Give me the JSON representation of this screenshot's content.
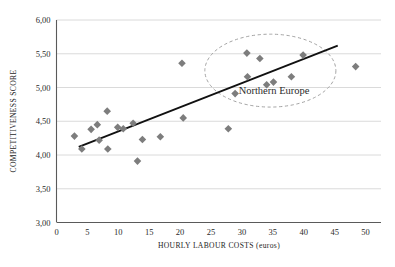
{
  "chart_data": {
    "type": "scatter",
    "title": "",
    "xlabel": "HOURLY LABOUR COSTS (euros)",
    "ylabel": "COMPETITIVENESS SCORE",
    "xlim": [
      0,
      52.5
    ],
    "ylim": [
      3.0,
      6.0
    ],
    "xticks": [
      0,
      5,
      10,
      15,
      20,
      25,
      30,
      35,
      40,
      45,
      50
    ],
    "xtick_labels": [
      "0",
      "5",
      "10",
      "15",
      "20",
      "25",
      "30",
      "35",
      "40",
      "45",
      "50"
    ],
    "yticks": [
      3.0,
      3.5,
      4.0,
      4.5,
      5.0,
      5.5,
      6.0
    ],
    "ytick_labels": [
      "3,00",
      "3,50",
      "4,00",
      "4,50",
      "5,00",
      "5,50",
      "6,00"
    ],
    "grid": "horizontal",
    "legend": "none",
    "decimal_separator": ",",
    "marker": {
      "shape": "diamond",
      "color": "#7d7d7d",
      "size": 7.6
    },
    "points": [
      {
        "x": 2.9,
        "y": 4.28
      },
      {
        "x": 4.1,
        "y": 4.09
      },
      {
        "x": 5.6,
        "y": 4.38
      },
      {
        "x": 6.6,
        "y": 4.45
      },
      {
        "x": 6.9,
        "y": 4.22
      },
      {
        "x": 8.2,
        "y": 4.65
      },
      {
        "x": 8.3,
        "y": 4.09
      },
      {
        "x": 9.9,
        "y": 4.41
      },
      {
        "x": 10.8,
        "y": 4.39
      },
      {
        "x": 12.4,
        "y": 4.47
      },
      {
        "x": 13.1,
        "y": 3.91
      },
      {
        "x": 13.9,
        "y": 4.23
      },
      {
        "x": 16.8,
        "y": 4.27
      },
      {
        "x": 20.3,
        "y": 5.36
      },
      {
        "x": 20.5,
        "y": 4.55
      },
      {
        "x": 27.8,
        "y": 4.39
      },
      {
        "x": 28.9,
        "y": 4.91
      },
      {
        "x": 30.8,
        "y": 5.51
      },
      {
        "x": 30.9,
        "y": 5.16
      },
      {
        "x": 32.9,
        "y": 5.43
      },
      {
        "x": 34.0,
        "y": 5.04
      },
      {
        "x": 35.1,
        "y": 5.08
      },
      {
        "x": 38.0,
        "y": 5.16
      },
      {
        "x": 39.9,
        "y": 5.48
      },
      {
        "x": 48.4,
        "y": 5.31
      }
    ],
    "trendline": {
      "type": "linear",
      "color": "#111111",
      "x_start": 3.6,
      "y_start": 4.12,
      "x_end": 45.5,
      "y_end": 5.62
    },
    "annotations": [
      {
        "label": "Northern Europe",
        "shape": "dashed-ellipse",
        "center_x": 34.6,
        "center_y": 5.25,
        "radius_x": 10.6,
        "radius_y": 0.54,
        "label_x": 35.2,
        "label_y": 4.9,
        "stroke": "#9a9a9a"
      }
    ],
    "colors": {
      "marker": "#7d7d7d",
      "trendline": "#111111",
      "gridline": "#d6d6d6",
      "axis": "#5a5a5a",
      "annotation": "#9a9a9a",
      "text": "#2b2b2b",
      "background": "#ffffff"
    }
  }
}
